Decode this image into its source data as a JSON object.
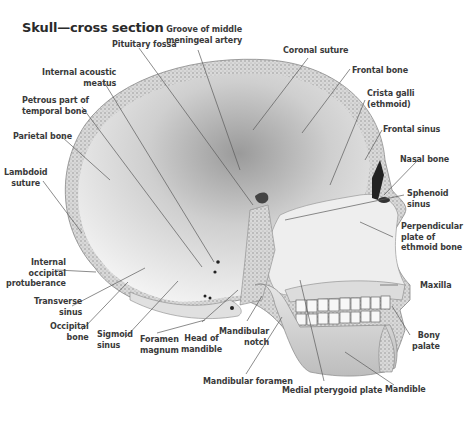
{
  "title": "Skull—cross section",
  "colors": {
    "text": "#3a3a3a",
    "bone_light": "#f2f2f2",
    "bone_mid": "#c8c8c8",
    "bone_dark": "#7a7a7a",
    "leader": "#5a5a5a"
  },
  "labels": {
    "pituitary_fossa": "Pituitary fossa",
    "groove_mma": "Groove of middle\nmeningeal artery",
    "coronal_suture": "Coronal suture",
    "internal_acoustic_meatus": "Internal acoustic\nmeatus",
    "frontal_bone": "Frontal bone",
    "petrous_part": "Petrous part of\ntemporal bone",
    "crista_galli": "Crista galli\n(ethmoid)",
    "parietal_bone": "Parietal bone",
    "frontal_sinus": "Frontal sinus",
    "lambdoid_suture": "Lambdoid\nsuture",
    "nasal_bone": "Nasal bone",
    "sphenoid_sinus": "Sphenoid\nsinus",
    "perpendicular_plate": "Perpendicular\nplate of\nethmoid bone",
    "internal_occipital_protuberance": "Internal\noccipital\nprotuberance",
    "maxilla": "Maxilla",
    "transverse_sinus": "Transverse\nsinus",
    "bony_palate": "Bony\npalate",
    "occipital_bone": "Occipital\nbone",
    "sigmoid_sinus": "Sigmoid\nsinus",
    "foramen_magnum": "Foramen\nmagnum",
    "head_of_mandible": "Head of\nmandible",
    "mandibular_notch": "Mandibular\nnotch",
    "mandibular_foramen": "Mandibular foramen",
    "medial_pterygoid_plate": "Medial pterygoid plate",
    "mandible": "Mandible"
  }
}
